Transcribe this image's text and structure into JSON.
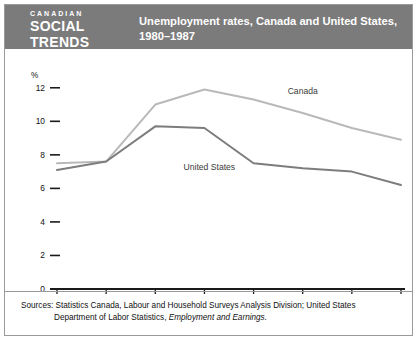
{
  "header": {
    "logo_line1": "CANADIAN",
    "logo_line2": "SOCIAL",
    "logo_line3": "TRENDS",
    "title_line1": "Unemployment rates, Canada and United States,",
    "title_line2": "1980–1987",
    "bar_color": "#7b7b7b",
    "text_color": "#ffffff"
  },
  "footer": {
    "sources_line1": "Sources: Statistics Canada, Labour and Household Surveys Analysis Division; United States",
    "sources_line2_plain": "Department of Labor Statistics, ",
    "sources_line2_italic": "Employment and Earnings."
  },
  "chart_data": {
    "type": "line",
    "title": "Unemployment rates, Canada and United States, 1980–1987",
    "xlabel": "",
    "ylabel": "%",
    "categories": [
      "1980",
      "1981",
      "1982",
      "1983",
      "1984",
      "1985",
      "1986",
      "1987"
    ],
    "x": [
      1980,
      1981,
      1982,
      1983,
      1984,
      1985,
      1986,
      1987
    ],
    "yticks": [
      "0",
      "2",
      "4",
      "6",
      "8",
      "10",
      "12"
    ],
    "ytick_values": [
      0,
      2,
      4,
      6,
      8,
      10,
      12
    ],
    "ylim": [
      0,
      13
    ],
    "xlim": [
      1980,
      1987
    ],
    "grid": false,
    "legend": "inline-annotations",
    "series": [
      {
        "name": "Canada",
        "color": "#b9b9b9",
        "label_x": 1985.0,
        "label_y": 11.6,
        "values": [
          7.5,
          7.6,
          11.0,
          11.9,
          11.3,
          10.5,
          9.6,
          8.9
        ]
      },
      {
        "name": "United States",
        "color": "#7d7d7d",
        "label_x": 1983.1,
        "label_y": 7.1,
        "values": [
          7.1,
          7.6,
          9.7,
          9.6,
          7.5,
          7.2,
          7.0,
          6.2
        ]
      }
    ],
    "annotations": [
      "Canada",
      "United States"
    ],
    "axis_color": "#1a1a1a"
  }
}
